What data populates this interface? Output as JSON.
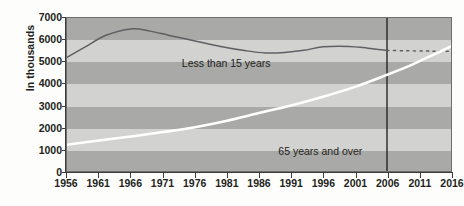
{
  "chart_data": {
    "type": "line",
    "title": "",
    "xlabel": "",
    "ylabel": "In thousands",
    "ylim": [
      0,
      7000
    ],
    "ytick_step": 1000,
    "yticks": [
      "0",
      "1000",
      "2000",
      "3000",
      "4000",
      "5000",
      "6000",
      "7000"
    ],
    "xlim": [
      1956,
      2016
    ],
    "xticks": [
      "1956",
      "1961",
      "1966",
      "1971",
      "1976",
      "1981",
      "1986",
      "1991",
      "1996",
      "2001",
      "2006",
      "2011",
      "2016"
    ],
    "grid": "alternating horizontal bands every 1000 units",
    "legend_position": "inline annotations on plot",
    "projection_divider_year": 2006,
    "series": [
      {
        "name": "Less than 15 years",
        "color": "#5f6063",
        "style": "solid with dashed projection after 2006",
        "label_x_year": 1974,
        "label_y_value": 5130,
        "x": [
          1956,
          1959,
          1962,
          1966,
          1969,
          1972,
          1976,
          1980,
          1984,
          1987,
          1990,
          1993,
          1996,
          2000,
          2003,
          2006
        ],
        "values": [
          5200,
          5700,
          6200,
          6500,
          6400,
          6200,
          5950,
          5700,
          5500,
          5400,
          5420,
          5520,
          5680,
          5700,
          5620,
          5520
        ],
        "projected_x": [
          2006,
          2009,
          2012,
          2014,
          2016
        ],
        "projected_values": [
          5520,
          5500,
          5490,
          5480,
          5480
        ]
      },
      {
        "name": "65 years and over",
        "color": "#ffffff",
        "style": "solid thick white line",
        "label_x_year": 1989,
        "label_y_value": 1180,
        "x": [
          1956,
          1961,
          1966,
          1971,
          1976,
          1981,
          1986,
          1991,
          1996,
          2001,
          2006
        ],
        "values": [
          1200,
          1400,
          1580,
          1780,
          2000,
          2300,
          2650,
          3000,
          3400,
          3850,
          4400
        ],
        "projected_x": [
          2006,
          2009,
          2012,
          2014,
          2016
        ],
        "projected_values": [
          4400,
          4750,
          5150,
          5420,
          5700
        ]
      }
    ]
  },
  "labels": {
    "y_axis_title": "In thousands",
    "series_1": "Less than 15 years",
    "series_2": "65 years and over"
  },
  "colors": {
    "background": "#fdfdfc",
    "band_light": "#d2d2d0",
    "band_dark": "#a9a9a7",
    "line_dark": "#5f6063",
    "line_white": "#ffffff",
    "axis": "#3b3b3b",
    "plot_border": "#6e6e6e",
    "divider": "#1a1a1a",
    "text": "#231f20"
  }
}
